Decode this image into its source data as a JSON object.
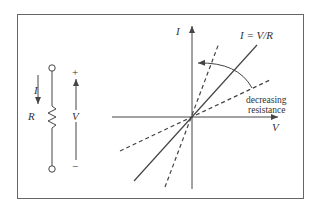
{
  "circuit": {
    "current_label": "I",
    "resistor_label": "R",
    "voltage_label": "V",
    "plus_sign": "+",
    "minus_sign": "−"
  },
  "graph": {
    "y_axis_label": "I",
    "x_axis_label": "V",
    "line_label": "I = V/R",
    "annotation_line1": "decreasing",
    "annotation_line2": "resistance"
  },
  "colors": {
    "stroke": "#444444",
    "text": "#333333",
    "frame": "#666666"
  }
}
